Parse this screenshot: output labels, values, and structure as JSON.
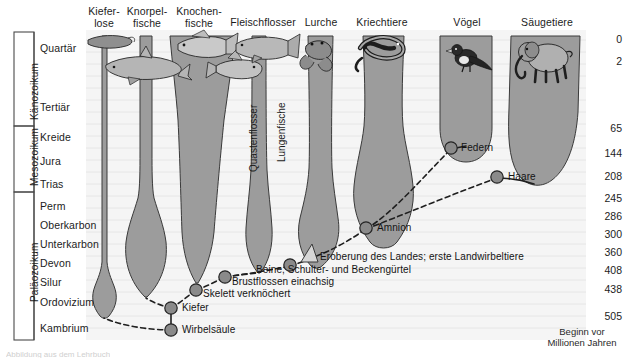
{
  "figure": {
    "axis_caption_line1": "Beginn vor",
    "axis_caption_line2": "Millionen Jahren",
    "bottom_cut_text": "Abbildung aus dem Lehrbuch"
  },
  "colors": {
    "lineage_fill": "#9c9c9c",
    "lineage_stroke": "#3a3a3a",
    "background": "#f7f7f7",
    "gridline": "#e3e3e3",
    "node_fill": "#8a8a8a",
    "node_stroke": "#2b2b2b",
    "text": "#1c1c1c"
  },
  "eras": [
    {
      "name": "Känozoikum",
      "top": 32,
      "bottom": 126
    },
    {
      "name": "Mesozoikum",
      "top": 126,
      "bottom": 192
    },
    {
      "name": "Paläozoikum",
      "top": 192,
      "bottom": 340
    }
  ],
  "periods": [
    {
      "name": "Quartär",
      "y": 47,
      "mya": 0
    },
    {
      "name": "Tertiär",
      "y": 106,
      "mya": 2
    },
    {
      "name": "Kreide",
      "y": 136,
      "mya": 65
    },
    {
      "name": "Jura",
      "y": 160,
      "mya": 144
    },
    {
      "name": "Trias",
      "y": 183,
      "mya": 208
    },
    {
      "name": "Perm",
      "y": 205,
      "mya": 245
    },
    {
      "name": "Oberkarbon",
      "y": 224,
      "mya": 286
    },
    {
      "name": "Unterkarbon",
      "y": 243,
      "mya": 300
    },
    {
      "name": "Devon",
      "y": 262,
      "mya": 360
    },
    {
      "name": "Silur",
      "y": 281,
      "mya": 408
    },
    {
      "name": "Ordovizium",
      "y": 301,
      "mya": 438
    },
    {
      "name": "Kambrium",
      "y": 327,
      "mya": 505
    }
  ],
  "mya_labels": [
    {
      "value": "0",
      "y": 39
    },
    {
      "value": "2",
      "y": 61
    },
    {
      "value": "65",
      "y": 128
    },
    {
      "value": "144",
      "y": 153
    },
    {
      "value": "208",
      "y": 176
    },
    {
      "value": "245",
      "y": 198
    },
    {
      "value": "286",
      "y": 215
    },
    {
      "value": "300",
      "y": 233
    },
    {
      "value": "360",
      "y": 251
    },
    {
      "value": "408",
      "y": 269
    },
    {
      "value": "438",
      "y": 288
    },
    {
      "value": "505",
      "y": 315
    }
  ],
  "lineages": [
    {
      "id": "kieferlose",
      "label": "Kiefer-\nlose",
      "label_lines": [
        "Kiefer-",
        "lose"
      ],
      "x": 104,
      "origin_y": 316,
      "icon": "lamprey-icon"
    },
    {
      "id": "knorpelfische",
      "label": "Knorpel-\nfische",
      "label_lines": [
        "Knorpel-",
        "fische"
      ],
      "x": 145,
      "origin_y": 297,
      "icon": "shark-icon"
    },
    {
      "id": "knochenfische",
      "label": "Knochen-\nfische",
      "label_lines": [
        "Knochen-",
        "fische"
      ],
      "x": 196,
      "origin_y": 283,
      "icon": "bonyfish-icon"
    },
    {
      "id": "fleischflosser",
      "label": "Fleischflosser",
      "label_lines": [
        "Fleischflosser"
      ],
      "x": 258,
      "origin_y": 273,
      "icon": "lobefin-icon"
    },
    {
      "id": "lurche",
      "label": "Lurche",
      "label_lines": [
        "Lurche"
      ],
      "x": 320,
      "origin_y": 266,
      "icon": "frog-icon"
    },
    {
      "id": "kriechtiere",
      "label": "Kriechtiere",
      "label_lines": [
        "Kriechtiere"
      ],
      "x": 381,
      "origin_y": 240,
      "icon": "reptile-icon"
    },
    {
      "id": "voegel",
      "label": "Vögel",
      "label_lines": [
        "Vögel"
      ],
      "x": 464,
      "origin_y": 146,
      "icon": "bird-icon"
    },
    {
      "id": "saeugetiere",
      "label": "Säugetiere",
      "label_lines": [
        "Säugetiere"
      ],
      "x": 545,
      "origin_y": 176,
      "icon": "mammal-icon"
    }
  ],
  "inner_labels": [
    {
      "text": "Quastenflosser",
      "x": 243,
      "y": 121
    },
    {
      "text": "Lungenfische",
      "x": 272,
      "y": 116
    }
  ],
  "nodes": [
    {
      "id": "wirbelsaeule",
      "label": "Wirbelsäule",
      "x": 171,
      "y": 330,
      "label_x": 182,
      "label_y": 334
    },
    {
      "id": "kiefer",
      "label": "Kiefer",
      "x": 171,
      "y": 308,
      "label_x": 182,
      "label_y": 312
    },
    {
      "id": "skelett",
      "label": "Skelett verknöchert",
      "x": 196,
      "y": 290,
      "label_x": 207,
      "label_y": 296
    },
    {
      "id": "brustflossen",
      "label": "Brustflossen einachsig",
      "x": 225,
      "y": 277,
      "label_x": 234,
      "label_y": 284
    },
    {
      "id": "beine",
      "label": "Beine, Schulter- und Beckengürtel",
      "x": 290,
      "y": 265,
      "label_x": 258,
      "label_y": 272
    },
    {
      "id": "landgang",
      "label": "Eroberung des Landes; erste Landwirbeltiere",
      "x": 312,
      "y": 256,
      "label_x": 321,
      "label_y": 259
    },
    {
      "id": "amnion",
      "label": "Amnion",
      "x": 366,
      "y": 228,
      "label_x": 378,
      "label_y": 231
    },
    {
      "id": "federn",
      "label": "Federn",
      "x": 451,
      "y": 148,
      "label_x": 462,
      "label_y": 151
    },
    {
      "id": "haare",
      "label": "Haare",
      "x": 497,
      "y": 177,
      "label_x": 509,
      "label_y": 180
    }
  ]
}
